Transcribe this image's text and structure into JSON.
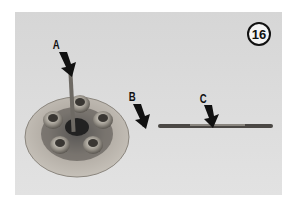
{
  "figure": {
    "number": "16"
  },
  "callouts": [
    {
      "label": "A",
      "target": "lifter-rod"
    },
    {
      "label": "B",
      "target": "steel-ball"
    },
    {
      "label": "C",
      "target": "pushrod"
    }
  ],
  "colors": {
    "background": "#dcdcdc",
    "page": "#ffffff",
    "ink": "#111111"
  }
}
